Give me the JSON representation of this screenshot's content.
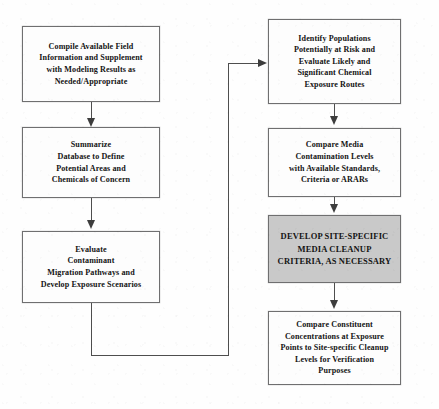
{
  "diagram": {
    "background_color": "#fefefe",
    "box_border_color": "#6f6f70",
    "box_fill_color": "#fdfdfd",
    "shaded_box_fill_color": "#c9c9c9",
    "connector_color": "#4e4e4e",
    "nodes": [
      {
        "id": "compile-available-field-information",
        "column": "left",
        "shaded": false,
        "lines": [
          "Compile Available Field",
          "Information and Supplement",
          "with Modeling Results as",
          "Needed/Appropriate"
        ]
      },
      {
        "id": "summarize-database",
        "column": "left",
        "shaded": false,
        "lines": [
          "Summarize",
          "Database to Define",
          "Potential Areas and",
          "Chemicals of Concern"
        ]
      },
      {
        "id": "evaluate-contaminant-migration",
        "column": "left",
        "shaded": false,
        "lines": [
          "Evaluate",
          "Contaminant",
          "Migration Pathways and",
          "Develop Exposure Scenarios"
        ]
      },
      {
        "id": "identify-populations-at-risk",
        "column": "right",
        "shaded": false,
        "lines": [
          "Identify Populations",
          "Potentially at Risk and",
          "Evaluate Likely and",
          "Significant Chemical",
          "Exposure Routes"
        ]
      },
      {
        "id": "compare-media-contamination-levels",
        "column": "right",
        "shaded": false,
        "lines": [
          "Compare Media",
          "Contamination Levels",
          "with Available Standards,",
          "Criteria or ARARs"
        ]
      },
      {
        "id": "develop-site-specific-media-cleanup-criteria",
        "column": "right",
        "shaded": true,
        "lines": [
          "DEVELOP SITE-SPECIFIC",
          "MEDIA CLEANUP",
          "CRITERIA, AS NECESSARY"
        ]
      },
      {
        "id": "compare-constituent-concentrations",
        "column": "right",
        "shaded": false,
        "lines": [
          "Compare Constituent",
          "Concentrations at Exposure",
          "Points to Site-specific Cleanup",
          "Levels for Verification",
          "Purposes"
        ]
      }
    ],
    "connectors": [
      {
        "id": "compile-to-summarize",
        "type": "vertical-arrow"
      },
      {
        "id": "summarize-to-evaluate",
        "type": "vertical-arrow"
      },
      {
        "id": "evaluate-to-identify-populations",
        "type": "elbow-arrow-right"
      },
      {
        "id": "identify-to-compare-media",
        "type": "vertical-arrow"
      },
      {
        "id": "compare-media-to-develop-criteria",
        "type": "vertical-arrow"
      },
      {
        "id": "develop-criteria-to-compare-constituent",
        "type": "vertical-arrow"
      }
    ]
  }
}
